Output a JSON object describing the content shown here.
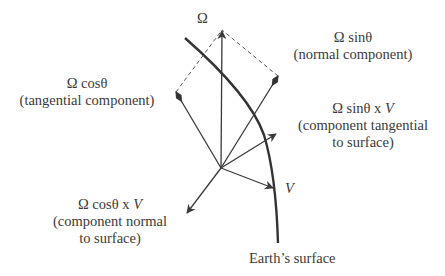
{
  "diagram": {
    "colors": {
      "ink": "#3a3a3a",
      "earth_line": "#333333",
      "background": "#ffffff"
    },
    "labels": {
      "omega": "Ω",
      "omega_cos": {
        "formula": "Ω cosθ",
        "description": "(tangential component)"
      },
      "omega_sin": {
        "formula": "Ω sinθ",
        "description": "(normal component)"
      },
      "omega_sin_x_v": {
        "formula_prefix": "Ω sinθ x ",
        "formula_var": "V",
        "description_line1": "(component tangential",
        "description_line2": "to surface)"
      },
      "omega_cos_x_v": {
        "formula_prefix": "Ω cosθ x ",
        "formula_var": "V",
        "description_line1": "(component normal",
        "description_line2": "to surface)"
      },
      "velocity": "V",
      "earth_surface": "Earth’s surface"
    },
    "vectors": [
      {
        "name": "omega",
        "from": [
          221,
          168
        ],
        "to": [
          222,
          30
        ],
        "head": "arrow"
      },
      {
        "name": "omega-cos-tangential",
        "from": [
          221,
          168
        ],
        "to": [
          176,
          92
        ],
        "head": "diamond"
      },
      {
        "name": "omega-sin-normal",
        "from": [
          221,
          168
        ],
        "to": [
          278,
          76
        ],
        "head": "diamond"
      },
      {
        "name": "omega-sin-x-v",
        "from": [
          221,
          168
        ],
        "to": [
          276,
          134
        ],
        "head": "arrow"
      },
      {
        "name": "velocity-v",
        "from": [
          221,
          168
        ],
        "to": [
          273,
          188
        ],
        "head": "arrow"
      },
      {
        "name": "omega-cos-x-v",
        "from": [
          221,
          168
        ],
        "to": [
          187,
          213
        ],
        "head": "arrow"
      }
    ]
  }
}
